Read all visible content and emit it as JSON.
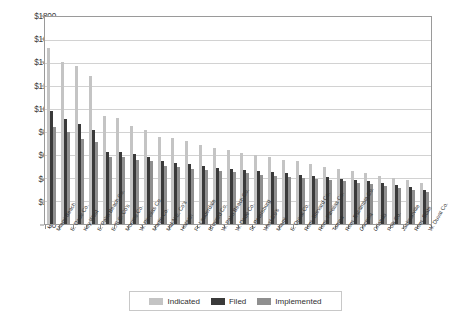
{
  "chart_data": {
    "type": "bar",
    "title": "",
    "xlabel": "",
    "ylabel": "",
    "ylim": [
      0,
      1800
    ],
    "ytick_step": 200,
    "ytick_labels": [
      "$0",
      "$200",
      "$400",
      "$600",
      "$800",
      "$1000",
      "$1200",
      "$1400",
      "$1600",
      "$1800"
    ],
    "grid": true,
    "legend_position": "bottom",
    "currency_prefix": "$",
    "categories": [
      "Miami Beach",
      "E. Dade Co.",
      "Key West",
      "E. Palm Beach Co.",
      "E./S.C. Co's",
      "Monroe Co.",
      "W. Pinellas Co.",
      "Martin Co.",
      "Mid-N.E. Co's",
      "Hialeah",
      "Ft. Lauderdale",
      "Broward Co.",
      "W. Palm Beach Co.",
      "W. Dade Co.",
      "St. Petersburg",
      "West Co's",
      "Miami",
      "E. Duval Co.",
      "Rem. Brevard Co.",
      "Rem. Pinellas Co.",
      "Tampa",
      "Rem. Escambia Co.",
      "Osceola",
      "Orlando",
      "Polk Co.",
      "Jacksonville",
      "Rem. State",
      "W. Duval Co."
    ],
    "series": [
      {
        "name": "Indicated",
        "color": "#c4c4c4",
        "values": [
          1530,
          1405,
          1370,
          1285,
          935,
          920,
          855,
          820,
          760,
          745,
          720,
          690,
          665,
          640,
          620,
          600,
          580,
          560,
          545,
          520,
          500,
          480,
          460,
          440,
          420,
          400,
          380,
          360
        ]
      },
      {
        "name": "Filed",
        "color": "#3a3a3a",
        "values": [
          985,
          910,
          870,
          820,
          630,
          625,
          610,
          580,
          545,
          530,
          520,
          505,
          490,
          480,
          470,
          460,
          450,
          440,
          430,
          420,
          405,
          395,
          385,
          370,
          355,
          340,
          320,
          300
        ]
      },
      {
        "name": "Implemented",
        "color": "#8f8f8f",
        "values": [
          845,
          800,
          740,
          715,
          585,
          580,
          560,
          545,
          505,
          495,
          480,
          470,
          460,
          450,
          440,
          430,
          420,
          410,
          400,
          390,
          380,
          370,
          360,
          345,
          330,
          315,
          295,
          275
        ]
      }
    ]
  },
  "legend": {
    "items": [
      {
        "label": "Indicated",
        "key": "indicated"
      },
      {
        "label": "Filed",
        "key": "filed"
      },
      {
        "label": "Implemented",
        "key": "implemented"
      }
    ]
  }
}
